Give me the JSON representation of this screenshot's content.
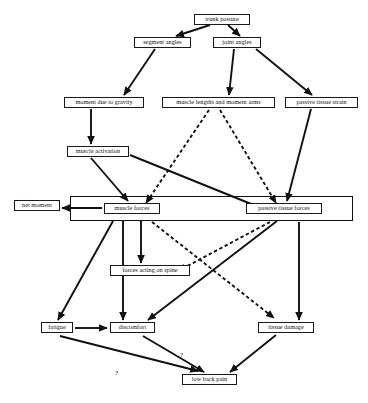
{
  "diagram": {
    "canvas": {
      "width": 368,
      "height": 403
    },
    "stroke_color": "#111111",
    "node_fill": "#ffffff",
    "nodes": [
      {
        "id": "trunk_posture",
        "label": "trunk posture",
        "x": 194,
        "y": 14,
        "w": 56
      },
      {
        "id": "segment_angles",
        "label": "segment angles",
        "x": 134,
        "y": 37,
        "w": 57
      },
      {
        "id": "joint_angles",
        "label": "joint angles",
        "x": 213,
        "y": 37,
        "w": 48
      },
      {
        "id": "moment_gravity",
        "label": "moment due to gravity",
        "x": 64,
        "y": 97,
        "w": 80
      },
      {
        "id": "muscle_lengths",
        "label": "muscle lengths  and moment arms",
        "x": 162,
        "y": 97,
        "w": 113
      },
      {
        "id": "passive_strain",
        "label": "passive tissue strain",
        "x": 285,
        "y": 97,
        "w": 73
      },
      {
        "id": "muscle_activation",
        "label": "muscle activation",
        "x": 67,
        "y": 146,
        "w": 62
      },
      {
        "id": "net_moment",
        "label": "net moment",
        "x": 14,
        "y": 200,
        "w": 46
      },
      {
        "id": "muscle_forces",
        "label": "muscle forces",
        "x": 104,
        "y": 203,
        "w": 56
      },
      {
        "id": "passive_forces",
        "label": "passive tissue forces",
        "x": 246,
        "y": 203,
        "w": 76
      },
      {
        "id": "forces_spine",
        "label": "forces acting on spine",
        "x": 110,
        "y": 265,
        "w": 80
      },
      {
        "id": "fatigue",
        "label": "fatigue",
        "x": 41,
        "y": 322,
        "w": 32
      },
      {
        "id": "discomfort",
        "label": "discomfort",
        "x": 110,
        "y": 322,
        "w": 45
      },
      {
        "id": "tissue_damage",
        "label": "tissue damage",
        "x": 258,
        "y": 322,
        "w": 56
      },
      {
        "id": "low_back_pain",
        "label": "low back pain",
        "x": 182,
        "y": 374,
        "w": 55
      }
    ],
    "group_boxes": [
      {
        "id": "internal-loading-group",
        "label": "internal loading group",
        "x": 70,
        "y": 196,
        "w": 283,
        "h": 25
      }
    ],
    "edge_annotations": [
      {
        "id": "q1",
        "label": "?",
        "x": 180,
        "y": 351
      },
      {
        "id": "q2",
        "label": "?",
        "x": 115,
        "y": 369
      }
    ],
    "edges": [
      {
        "from": "trunk_posture",
        "to": "segment_angles",
        "style": "solid"
      },
      {
        "from": "trunk_posture",
        "to": "joint_angles",
        "style": "solid"
      },
      {
        "from": "segment_angles",
        "to": "moment_gravity",
        "style": "solid"
      },
      {
        "from": "joint_angles",
        "to": "muscle_lengths",
        "style": "solid"
      },
      {
        "from": "joint_angles",
        "to": "passive_strain",
        "style": "solid"
      },
      {
        "from": "moment_gravity",
        "to": "muscle_activation",
        "style": "solid"
      },
      {
        "from": "muscle_activation",
        "to": "muscle_forces",
        "style": "solid"
      },
      {
        "from": "muscle_activation",
        "to": "passive_forces",
        "style": "solid"
      },
      {
        "from": "muscle_lengths",
        "to": "muscle_forces",
        "style": "dashed"
      },
      {
        "from": "muscle_lengths",
        "to": "passive_forces",
        "style": "dashed"
      },
      {
        "from": "passive_strain",
        "to": "passive_forces",
        "style": "solid"
      },
      {
        "from": "muscle_forces",
        "to": "net_moment",
        "style": "solid"
      },
      {
        "from": "muscle_forces",
        "to": "forces_spine",
        "style": "solid"
      },
      {
        "from": "muscle_forces",
        "to": "discomfort",
        "style": "solid"
      },
      {
        "from": "muscle_forces",
        "to": "fatigue",
        "style": "solid"
      },
      {
        "from": "muscle_forces",
        "to": "tissue_damage",
        "style": "dashed"
      },
      {
        "from": "passive_forces",
        "to": "forces_spine",
        "style": "dashed"
      },
      {
        "from": "passive_forces",
        "to": "discomfort",
        "style": "solid"
      },
      {
        "from": "passive_forces",
        "to": "tissue_damage",
        "style": "solid"
      },
      {
        "from": "fatigue",
        "to": "discomfort",
        "style": "solid"
      },
      {
        "from": "fatigue",
        "to": "low_back_pain",
        "style": "solid",
        "annotation": "?"
      },
      {
        "from": "discomfort",
        "to": "low_back_pain",
        "style": "solid",
        "annotation": "?"
      },
      {
        "from": "tissue_damage",
        "to": "low_back_pain",
        "style": "solid"
      }
    ]
  }
}
